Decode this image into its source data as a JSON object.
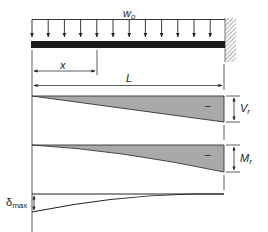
{
  "diagram": {
    "load_label": "w",
    "load_subscript": "o",
    "x_label": "x",
    "length_label": "L",
    "shear": {
      "label": "V",
      "subscript": "r",
      "sign": "–"
    },
    "moment": {
      "label": "M",
      "subscript": "r",
      "sign": "–"
    },
    "deflection": {
      "label": "δ",
      "subscript": "max"
    },
    "colors": {
      "beam": "#1a1a1a",
      "fill": "#a9a9a9",
      "line": "#333333",
      "hatch": "#777777"
    }
  }
}
